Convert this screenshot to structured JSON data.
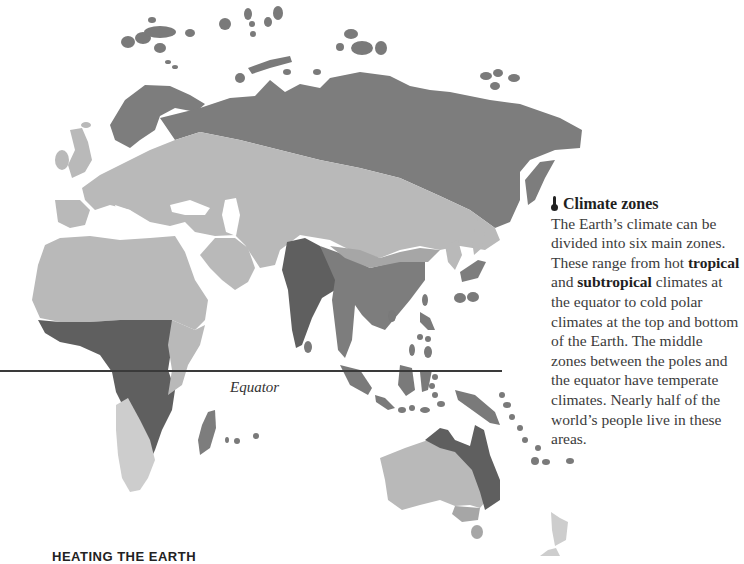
{
  "map": {
    "label": "Climate zone map of Eurasia, Africa and Australia",
    "equator_label": "Equator",
    "zone_colors": {
      "polar_subarctic": "#7d7d7d",
      "temperate_arid": "#b9b9b9",
      "tropical": "#5f5f5f",
      "subtropical": "#a6a6a6"
    }
  },
  "info": {
    "icon": "thermometer-icon",
    "title": "Climate zones",
    "text_1": "The Earth’s climate can be divided into six main zones. These range from hot ",
    "bold_1": "tropical",
    "text_2": " and ",
    "bold_2": "subtropical",
    "text_3": " climates at the equator to cold polar climates at the top and bottom of the Earth. The middle zones between the poles and the equator have temperate climates. Nearly half of the world’s people live in these areas."
  },
  "footer": {
    "heading": "HEATING THE EARTH"
  }
}
